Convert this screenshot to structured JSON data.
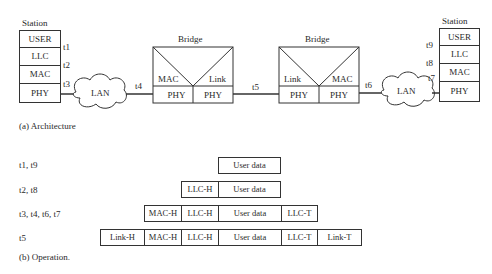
{
  "architecture": {
    "caption": "(a) Architecture",
    "left_station": {
      "title": "Station",
      "layers": [
        "USER",
        "LLC",
        "MAC",
        "PHY"
      ],
      "taps": [
        "t1",
        "t2",
        "t3"
      ]
    },
    "right_station": {
      "title": "Station",
      "layers": [
        "USER",
        "LLC",
        "MAC",
        "PHY"
      ],
      "taps": [
        "t9",
        "t8",
        "t7"
      ]
    },
    "lan_left": "LAN",
    "lan_right": "LAN",
    "bridge_left": {
      "title": "Bridge",
      "upper": [
        "MAC",
        "Link"
      ],
      "lower": [
        "PHY",
        "PHY"
      ]
    },
    "bridge_right": {
      "title": "Bridge",
      "upper": [
        "Link",
        "MAC"
      ],
      "lower": [
        "PHY",
        "PHY"
      ]
    },
    "links": {
      "t4": "t4",
      "t5": "t5",
      "t6": "t6"
    }
  },
  "operation": {
    "caption": "(b) Operation.",
    "rows": [
      {
        "label": "t1, t9",
        "fields": [
          "User data"
        ]
      },
      {
        "label": "t2, t8",
        "fields": [
          "LLC-H",
          "User data"
        ]
      },
      {
        "label": "t3, t4, t6, t7",
        "fields": [
          "MAC-H",
          "LLC-H",
          "User data",
          "LLC-T"
        ]
      },
      {
        "label": "t5",
        "fields": [
          "Link-H",
          "MAC-H",
          "LLC-H",
          "User data",
          "LLC-T",
          "Link-T"
        ]
      }
    ]
  }
}
